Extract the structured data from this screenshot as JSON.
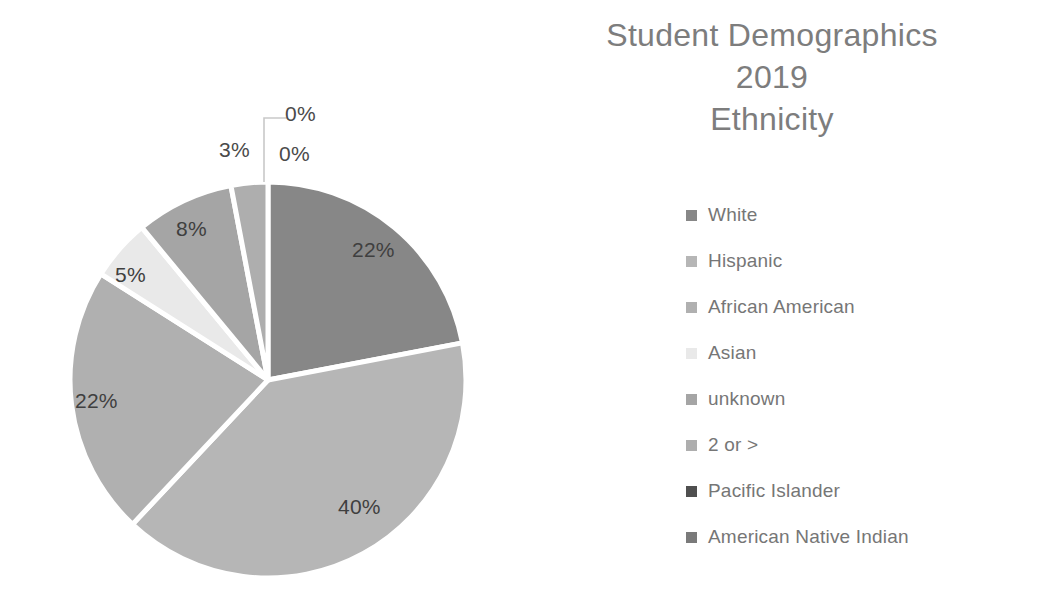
{
  "title": {
    "line1": "Student Demographics",
    "line2": "2019",
    "line3": "Ethnicity"
  },
  "legend": {
    "position": "right",
    "items": [
      {
        "label": "White",
        "color": "#878787"
      },
      {
        "label": "Hispanic",
        "color": "#b6b6b6"
      },
      {
        "label": "African American",
        "color": "#b0b0b0"
      },
      {
        "label": "Asian",
        "color": "#e9e9e9"
      },
      {
        "label": "unknown",
        "color": "#a5a5a5"
      },
      {
        "label": "2 or >",
        "color": "#aeaeae"
      },
      {
        "label": "Pacific Islander",
        "color": "#4f4f4f"
      },
      {
        "label": "American Native Indian",
        "color": "#7a7a7a"
      }
    ]
  },
  "chart_data": {
    "type": "pie",
    "title": "Student Demographics 2019 Ethnicity",
    "xlabel": "",
    "ylabel": "",
    "unit": "percent",
    "start_angle_deg": 0,
    "direction": "clockwise",
    "categories": [
      "White",
      "Hispanic",
      "African American",
      "Asian",
      "unknown",
      "2 or >",
      "Pacific Islander",
      "American Native Indian"
    ],
    "values": [
      22,
      40,
      22,
      5,
      8,
      3,
      0,
      0
    ],
    "slices": [
      {
        "name": "White",
        "value": 22,
        "label": "22%",
        "color": "#878787"
      },
      {
        "name": "Hispanic",
        "value": 40,
        "label": "40%",
        "color": "#b6b6b6"
      },
      {
        "name": "African American",
        "value": 22,
        "label": "22%",
        "color": "#b0b0b0"
      },
      {
        "name": "Asian",
        "value": 5,
        "label": "5%",
        "color": "#e9e9e9"
      },
      {
        "name": "unknown",
        "value": 8,
        "label": "8%",
        "color": "#a5a5a5"
      },
      {
        "name": "2 or >",
        "value": 3,
        "label": "3%",
        "color": "#aeaeae"
      },
      {
        "name": "Pacific Islander",
        "value": 0,
        "label": "0%",
        "color": "#4f4f4f"
      },
      {
        "name": "American Native Indian",
        "value": 0,
        "label": "0%",
        "color": "#7a7a7a"
      }
    ],
    "data_labels": [
      {
        "text": "22%",
        "slice": "White"
      },
      {
        "text": "40%",
        "slice": "Hispanic"
      },
      {
        "text": "22%",
        "slice": "African American"
      },
      {
        "text": "5%",
        "slice": "Asian"
      },
      {
        "text": "8%",
        "slice": "unknown"
      },
      {
        "text": "3%",
        "slice": "2 or >"
      },
      {
        "text": "0%",
        "slice": "Pacific Islander"
      },
      {
        "text": "0%",
        "slice": "American Native Indian"
      }
    ],
    "legend": [
      "White",
      "Hispanic",
      "African American",
      "Asian",
      "unknown",
      "2 or >",
      "Pacific Islander",
      "American Native Indian"
    ],
    "grid": false
  }
}
